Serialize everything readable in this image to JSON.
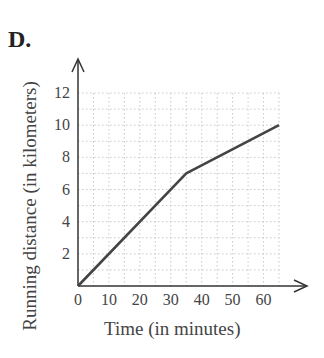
{
  "panel_label": "D.",
  "chart_data": {
    "type": "line",
    "title": "D.",
    "xlabel": "Time (in minutes)",
    "ylabel": "Running distance (in kilometers)",
    "xlim": [
      0,
      65
    ],
    "ylim": [
      0,
      12
    ],
    "x_ticks": [
      0,
      10,
      20,
      30,
      40,
      50,
      60
    ],
    "y_ticks": [
      2,
      4,
      6,
      8,
      10,
      12
    ],
    "grid": true,
    "grid_x_step": 5,
    "grid_y_step": 1,
    "legend": null,
    "series": [
      {
        "name": "Running distance",
        "x": [
          0,
          35,
          65
        ],
        "y": [
          0,
          7,
          10
        ],
        "color": "#444444"
      }
    ]
  }
}
